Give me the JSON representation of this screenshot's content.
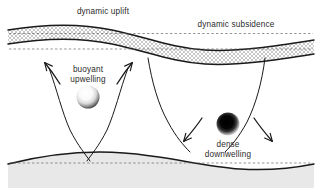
{
  "figure": {
    "background_color": "#ffffff",
    "width": 322,
    "height": 193
  },
  "labels": {
    "dynamic_uplift": "dynamic uplift",
    "dynamic_subsidence": "dynamic subsidence",
    "buoyant": "buoyant",
    "upwelling": "upwelling",
    "dense": "dense",
    "downwelling": "downwelling"
  },
  "layers": {
    "crust_band": {
      "name": "hatched lithosphere band",
      "fill_pattern": "cross-hatch",
      "pattern_color": "#9a9a9a",
      "stroke_color": "#1a1a1a"
    },
    "bottom_band": {
      "name": "lower boundary layer",
      "fill_color": "#e8e8e8",
      "stroke_color": "#1a1a1a"
    },
    "reference_lines": {
      "name": "undeformed reference level",
      "style": "dashed",
      "color": "#555555"
    }
  },
  "features": {
    "buoyant_sphere": {
      "name": "buoyant upwelling blob",
      "center_x": 88,
      "center_y": 97,
      "radius": 11,
      "shading": "light-radial-gradient",
      "core_color": "#ffffff",
      "rim_color": "#4a4a4a"
    },
    "dense_sphere": {
      "name": "dense downwelling blob",
      "center_x": 228,
      "center_y": 124,
      "radius": 11,
      "shading": "dark-radial-gradient",
      "core_color": "#000000",
      "rim_color": "#ffffff"
    },
    "flow_arrows": {
      "upwelling_left": "arrow pointing up-left",
      "upwelling_right": "arrow pointing up-right",
      "downwelling_left": "arrow pointing down-left",
      "downwelling_right": "arrow pointing down-right"
    }
  },
  "colors": {
    "line": "#1a1a1a",
    "text": "#2b2b2b",
    "hatch": "#9a9a9a",
    "bottom_fill": "#e8e8e8"
  }
}
